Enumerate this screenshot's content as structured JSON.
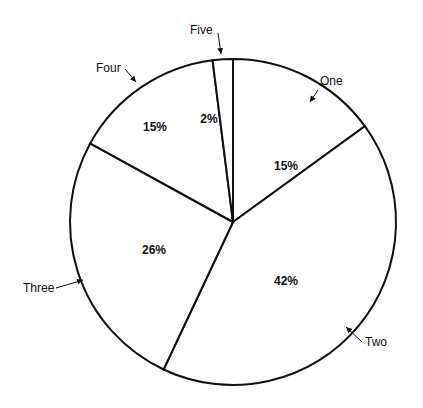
{
  "chart_data": {
    "type": "pie",
    "title": "",
    "categories": [
      "One",
      "Two",
      "Three",
      "Four",
      "Five"
    ],
    "values": [
      15,
      42,
      26,
      15,
      2
    ],
    "value_labels": [
      "15%",
      "42%",
      "26%",
      "15%",
      "2%"
    ],
    "start_angle_deg": 0,
    "direction": "clockwise",
    "legend": "none (callout labels with arrows)",
    "fill_color": "#ffffff",
    "stroke_color": "#111111"
  },
  "geometry": {
    "cx": 233,
    "cy": 222,
    "r": 163
  }
}
